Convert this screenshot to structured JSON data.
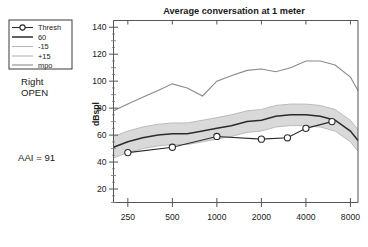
{
  "legend": {
    "items": [
      {
        "label": "Thresh",
        "marker": "circle-line",
        "color": "#2b2b2b"
      },
      {
        "label": "60",
        "marker": "line",
        "color": "#2b2b2b"
      },
      {
        "label": "-15",
        "marker": "line",
        "color": "#b5b5b5"
      },
      {
        "label": "+15",
        "marker": "line",
        "color": "#b5b5b5"
      },
      {
        "label": "mpo",
        "marker": "line",
        "color": "#8a8a8a"
      }
    ]
  },
  "side": {
    "ear": "Right",
    "mode": "OPEN",
    "aai": "AAI = 91"
  },
  "chart_data": {
    "type": "line",
    "title": "Average conversation at 1 meter",
    "xlabel": "",
    "ylabel": "dBspl",
    "xscale": "log",
    "xlim": [
      200,
      9000
    ],
    "ylim": [
      10,
      145
    ],
    "grid": false,
    "legend_position": "outside-left",
    "xticks": [
      250,
      500,
      1000,
      2000,
      4000,
      8000
    ],
    "xtick_labels": [
      "250",
      "500",
      "1000",
      "2000",
      "4000",
      "8000"
    ],
    "yticks": [
      20,
      40,
      60,
      80,
      100,
      120,
      140
    ],
    "ytick_labels": [
      "20",
      "40",
      "60",
      "80",
      "100",
      "120",
      "140"
    ],
    "yminorticks": [
      10,
      30,
      50,
      70,
      90,
      110,
      130
    ],
    "series": [
      {
        "name": "mpo",
        "color": "#8a8a8a",
        "x": [
          200,
          250,
          315,
          400,
          500,
          630,
          800,
          1000,
          1250,
          1600,
          2000,
          2500,
          3150,
          4000,
          5000,
          6300,
          8000,
          9000
        ],
        "values": [
          78,
          83,
          88,
          93,
          98,
          95,
          89,
          100,
          104,
          108,
          109,
          107,
          110,
          115,
          115,
          112,
          103,
          93
        ]
      },
      {
        "name": "+15",
        "color": "#b5b5b5",
        "x": [
          200,
          250,
          315,
          400,
          500,
          630,
          800,
          1000,
          1250,
          1600,
          2000,
          2500,
          3150,
          4000,
          5000,
          6300,
          8000,
          9000
        ],
        "values": [
          59,
          63,
          66,
          68,
          69,
          69,
          71,
          73,
          75,
          78,
          79,
          82,
          83,
          83,
          82,
          79,
          71,
          64
        ]
      },
      {
        "name": "60",
        "color": "#2b2b2b",
        "x": [
          200,
          250,
          315,
          400,
          500,
          630,
          800,
          1000,
          1250,
          1600,
          2000,
          2500,
          3150,
          4000,
          5000,
          6300,
          8000,
          9000
        ],
        "values": [
          51,
          55,
          58,
          60,
          61,
          61,
          63,
          65,
          67,
          70,
          71,
          74,
          75,
          75,
          74,
          71,
          63,
          56
        ]
      },
      {
        "name": "-15",
        "color": "#b5b5b5",
        "x": [
          200,
          250,
          315,
          400,
          500,
          630,
          800,
          1000,
          1250,
          1600,
          2000,
          2500,
          3150,
          4000,
          5000,
          6300,
          8000,
          9000
        ],
        "values": [
          43,
          47,
          50,
          52,
          53,
          53,
          55,
          57,
          59,
          62,
          63,
          66,
          67,
          67,
          66,
          63,
          55,
          48
        ]
      },
      {
        "name": "Thresh",
        "color": "#2b2b2b",
        "marker": "circle",
        "x": [
          250,
          500,
          1000,
          2000,
          3000,
          4000,
          6000
        ],
        "values": [
          47,
          51,
          59,
          57,
          58,
          65,
          70
        ]
      }
    ]
  }
}
